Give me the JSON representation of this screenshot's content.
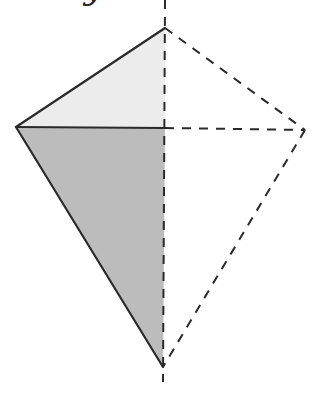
{
  "diagram": {
    "cut_off_text": "y",
    "colors": {
      "outline": "#2a2a2a",
      "upper_fill": "#ececec",
      "lower_fill": "#bcbcbc",
      "background": "#ffffff"
    },
    "vertices": {
      "top": [
        165,
        28
      ],
      "left": [
        16,
        127
      ],
      "right": [
        305,
        130
      ],
      "bottom": [
        163,
        367
      ],
      "center": [
        165,
        128
      ]
    },
    "axis": {
      "x": 165,
      "y_start": 0,
      "y_end": 382
    }
  }
}
